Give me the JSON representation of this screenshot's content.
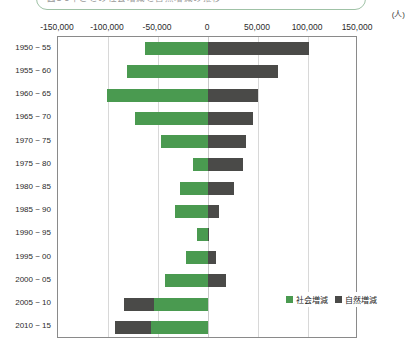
{
  "title": {
    "text": "図1 5年ごとの社会増減と自然増減の推移"
  },
  "unit_label": "(人)",
  "legend": {
    "items": [
      {
        "label": "社会増減",
        "color": "#4a9a50",
        "key": "social"
      },
      {
        "label": "自然増減",
        "color": "#4a4a48",
        "key": "natural"
      }
    ]
  },
  "axis": {
    "tick_labels": [
      "-150,000",
      "-100,000",
      "-50,000",
      "0",
      "50,000",
      "100,000",
      "150,000"
    ],
    "tick_values": [
      -150000,
      -100000,
      -50000,
      0,
      50000,
      100000,
      150000
    ]
  },
  "chart_data": {
    "type": "bar",
    "orientation": "horizontal",
    "stacked": true,
    "title": "図1 5年ごとの社会増減と自然増減の推移",
    "xlabel": "(人)",
    "ylabel": "",
    "xlim": [
      -150000,
      150000
    ],
    "grid": true,
    "legend_position": "bottom-right",
    "categories": [
      "1950 ~ 55",
      "1955 ~ 60",
      "1960 ~ 65",
      "1965 ~ 70",
      "1970 ~ 75",
      "1975 ~ 80",
      "1980 ~ 85",
      "1985 ~ 90",
      "1990 ~ 95",
      "1995 ~ 00",
      "2000 ~ 05",
      "2005 ~ 10",
      "2010 ~ 15"
    ],
    "series": [
      {
        "name": "社会増減",
        "color": "#4a9a50",
        "values": [
          -63000,
          -81000,
          -101000,
          -73000,
          -47000,
          -15000,
          -28000,
          -33000,
          -11000,
          -22000,
          -43000,
          -54000,
          -57000
        ]
      },
      {
        "name": "自然増減",
        "color": "#4a4a48",
        "values": [
          101000,
          70000,
          50000,
          45000,
          38000,
          35000,
          26000,
          11000,
          1000,
          8000,
          18000,
          -30000,
          -36000
        ]
      }
    ]
  }
}
